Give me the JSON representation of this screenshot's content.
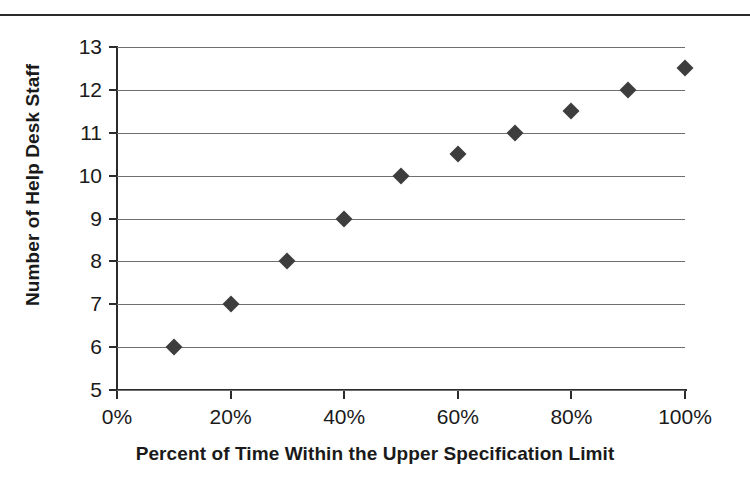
{
  "chart_data": {
    "type": "scatter",
    "title": "",
    "xlabel": "Percent of Time Within the Upper Specification Limit",
    "ylabel": "Number of Help Desk Staff",
    "x": [
      10,
      20,
      30,
      40,
      50,
      60,
      70,
      80,
      90,
      100
    ],
    "values": [
      6,
      7,
      8,
      9,
      10,
      10.5,
      11,
      11.5,
      12,
      12.5
    ],
    "series": [
      {
        "name": "Help Desk Staffing",
        "points": [
          {
            "x": 10,
            "y": 6
          },
          {
            "x": 20,
            "y": 7
          },
          {
            "x": 30,
            "y": 8
          },
          {
            "x": 40,
            "y": 9
          },
          {
            "x": 50,
            "y": 10
          },
          {
            "x": 60,
            "y": 10.5
          },
          {
            "x": 70,
            "y": 11
          },
          {
            "x": 80,
            "y": 11.5
          },
          {
            "x": 90,
            "y": 12
          },
          {
            "x": 100,
            "y": 12.5
          }
        ],
        "marker": "diamond",
        "color": "#3d3d3d"
      }
    ],
    "xlim": [
      0,
      100
    ],
    "ylim": [
      5,
      13
    ],
    "x_ticks": [
      0,
      20,
      40,
      60,
      80,
      100
    ],
    "x_tick_labels": [
      "0%",
      "20%",
      "40%",
      "60%",
      "80%",
      "100%"
    ],
    "y_ticks": [
      5,
      6,
      7,
      8,
      9,
      10,
      11,
      12,
      13
    ],
    "y_tick_labels": [
      "5",
      "6",
      "7",
      "8",
      "9",
      "10",
      "11",
      "12",
      "13"
    ],
    "grid": "horizontal",
    "legend": "none",
    "gridline_color": "#6f6f6f",
    "axis_color": "#2b2b2b",
    "background_color": "#ffffff"
  },
  "figure": {
    "top_rule": true
  }
}
